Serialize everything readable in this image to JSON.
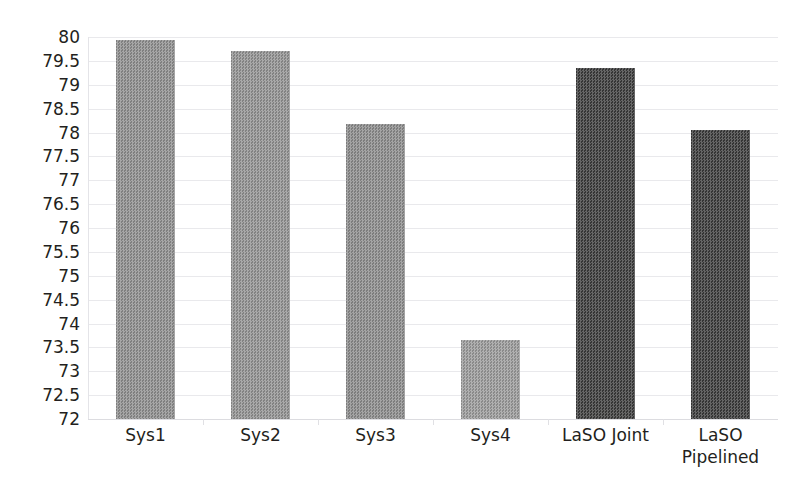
{
  "chart_data": {
    "type": "bar",
    "title": "",
    "subtitle": "",
    "xlabel": "",
    "ylabel": "",
    "categories": [
      "Sys1",
      "Sys2",
      "Sys3",
      "Sys4",
      "LaSO Joint",
      "LaSO\nPipelined"
    ],
    "values": [
      79.93,
      79.71,
      78.18,
      73.66,
      79.35,
      78.05
    ],
    "ylim": [
      72,
      80
    ],
    "ytick_step": 0.5,
    "ytick_labels": [
      "80",
      "79.5",
      "79",
      "78.5",
      "78",
      "77.5",
      "77",
      "76.5",
      "76",
      "75.5",
      "75",
      "74.5",
      "74",
      "73.5",
      "73",
      "72.5",
      "72"
    ],
    "ytick_values": [
      80,
      79.5,
      79,
      78.5,
      78,
      77.5,
      77,
      76.5,
      76,
      75.5,
      75,
      74.5,
      74,
      73.5,
      73,
      72.5,
      72
    ],
    "grid": true,
    "legend": null,
    "legend_position": "none",
    "bar_colors": [
      "#8d8d8d",
      "#919191",
      "#8b8b8b",
      "#9a9a9a",
      "#3b3b3b",
      "#3a3a3a"
    ],
    "series": [
      {
        "name": "score",
        "values": [
          79.93,
          79.71,
          78.18,
          73.66,
          79.35,
          78.05
        ]
      }
    ]
  },
  "colors": {
    "background": "#ffffff",
    "gridline": "#e9e9ec",
    "text": "#231f20",
    "bar_light": "#8d8d8d",
    "bar_dark": "#3b3b3b"
  }
}
